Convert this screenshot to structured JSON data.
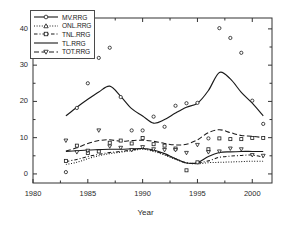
{
  "chart_data": {
    "type": "line",
    "title": "",
    "xlabel": "Year",
    "ylabel": "",
    "xlim": [
      1980,
      2001.8
    ],
    "ylim": [
      -2.5,
      43
    ],
    "xticks": [
      1980,
      1985,
      1990,
      1995,
      2000
    ],
    "yticks": [
      0,
      10,
      20,
      30,
      40
    ],
    "xtick_labels": [
      "1980",
      "1985",
      "1990",
      "1995",
      "2000"
    ],
    "ytick_labels": [
      "0",
      "10",
      "20",
      "30",
      "40"
    ],
    "grid": false,
    "minor_ticks": true,
    "legend_position": "upper-left",
    "x": [
      1983,
      1984,
      1985,
      1986,
      1987,
      1988,
      1989,
      1990,
      1991,
      1992,
      1993,
      1994,
      1995,
      1996,
      1997,
      1998,
      1999,
      2000,
      2001
    ],
    "series": [
      {
        "name": "MV.RRG",
        "marker": "circle",
        "linestyle": "solid",
        "color": "#1a1a1a",
        "values": [
          16.0,
          18.4,
          20.6,
          22.6,
          24.2,
          21.4,
          18.0,
          16.0,
          14.0,
          15.0,
          16.8,
          18.4,
          19.5,
          23.0,
          28.0,
          26.2,
          22.5,
          19.5,
          16.0
        ],
        "scatter": [
          0.5,
          18.2,
          25.0,
          32.0,
          34.8,
          21.2,
          12.0,
          12.0,
          15.8,
          13.0,
          18.8,
          19.5,
          19.6,
          9.8,
          40.2,
          37.5,
          33.4,
          20.2,
          13.8
        ]
      },
      {
        "name": "ONL.RRG",
        "marker": "triangle-up",
        "linestyle": "dotted",
        "color": "#1a1a1a",
        "values": [
          2.6,
          3.2,
          4.2,
          5.0,
          5.6,
          6.0,
          6.4,
          6.8,
          6.2,
          5.2,
          4.0,
          3.0,
          2.8,
          3.1,
          3.2,
          3.3,
          3.4,
          3.5,
          3.5
        ]
      },
      {
        "name": "TNL.RRG",
        "marker": "square",
        "linestyle": "dashed",
        "color": "#1a1a1a",
        "values": [
          3.4,
          4.0,
          4.8,
          5.4,
          5.9,
          6.2,
          6.6,
          7.0,
          6.4,
          5.4,
          4.2,
          3.1,
          3.0,
          3.6,
          4.6,
          4.9,
          5.1,
          5.2,
          4.6
        ],
        "scatter": [
          3.6,
          7.8,
          5.8,
          6.2,
          8.6,
          9.2,
          8.4,
          9.9,
          8.2,
          7.8,
          7.0,
          1.0,
          3.2,
          6.8,
          9.8,
          9.6,
          9.6,
          9.9,
          9.9
        ]
      },
      {
        "name": "TL.RRG",
        "marker": "none",
        "linestyle": "solid",
        "color": "#1a1a1a",
        "values": [
          6.2,
          6.4,
          6.6,
          6.7,
          6.8,
          6.8,
          6.9,
          7.0,
          6.6,
          5.6,
          4.2,
          3.0,
          3.1,
          4.8,
          5.9,
          6.1,
          6.2,
          6.2,
          6.2
        ]
      },
      {
        "name": "TOT.RRG",
        "marker": "triangle-down",
        "linestyle": "long-dashed",
        "color": "#1a1a1a",
        "values": [
          6.3,
          7.2,
          8.4,
          9.2,
          9.4,
          9.0,
          9.2,
          9.3,
          9.0,
          8.4,
          8.0,
          8.2,
          9.4,
          11.4,
          12.2,
          11.4,
          10.6,
          10.4,
          10.0
        ],
        "scatter": [
          9.2,
          6.0,
          6.4,
          12.0,
          7.6,
          7.2,
          6.6,
          7.4,
          6.8,
          6.6,
          6.6,
          5.8,
          8.0,
          6.0,
          6.2,
          7.0,
          6.8,
          5.2,
          5.0
        ]
      }
    ]
  },
  "legend": {
    "entries": [
      {
        "label": "MV.RRG"
      },
      {
        "label": "ONL.RRG"
      },
      {
        "label": "TNL.RRG"
      },
      {
        "label": "TL.RRG"
      },
      {
        "label": "TOT.RRG"
      }
    ]
  }
}
